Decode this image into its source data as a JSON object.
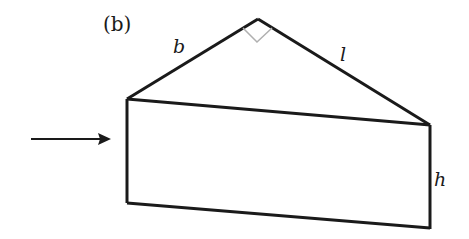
{
  "figure": {
    "panel_label": "(b)",
    "labels": {
      "b": "b",
      "l": "l",
      "h": "h"
    },
    "colors": {
      "stroke": "#1a1a1a",
      "right_angle_mark": "#b0b0b0",
      "background": "#ffffff"
    }
  }
}
